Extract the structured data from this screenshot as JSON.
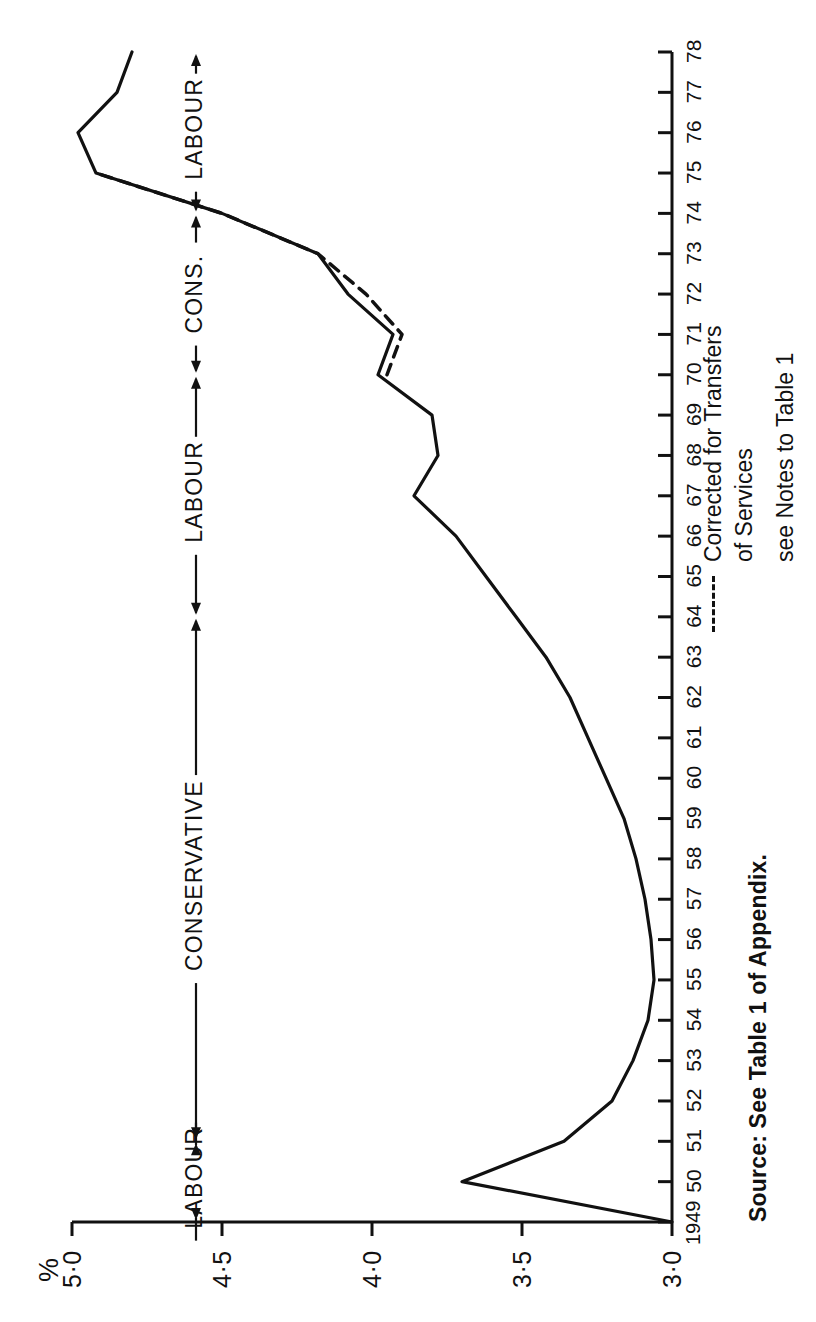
{
  "figure": {
    "orientation": "rotated-90-ccw",
    "y_axis_unit_label": "%",
    "source_note": "Source: See Table 1 of Appendix.",
    "ink_color": "#111111",
    "background_color": "#ffffff"
  },
  "legend": {
    "dash_sample_name": "dashed-line-sample",
    "lines": [
      "Corrected for Transfers",
      "of Services",
      "see Notes to Table 1"
    ]
  },
  "period_brackets": [
    {
      "label": "LABOUR",
      "start": 1949,
      "end": 1951
    },
    {
      "label": "CONSERVATIVE",
      "start": 1951,
      "end": 1964
    },
    {
      "label": "LABOUR",
      "start": 1964,
      "end": 1970
    },
    {
      "label": "CONS.",
      "start": 1970,
      "end": 1974
    },
    {
      "label": "LABOUR",
      "start": 1974,
      "end": 1978
    }
  ],
  "chart_data": {
    "type": "line",
    "title": "",
    "xlabel": "",
    "ylabel": "%",
    "xlim": [
      1949,
      1978
    ],
    "ylim": [
      3.0,
      5.0
    ],
    "yticks": [
      3.0,
      3.5,
      4.0,
      4.5,
      5.0
    ],
    "ytick_labels": [
      "3·0",
      "3·5",
      "4·0",
      "4·5",
      "5·0"
    ],
    "xticks": [
      1949,
      1950,
      1951,
      1952,
      1953,
      1954,
      1955,
      1956,
      1957,
      1958,
      1959,
      1960,
      1961,
      1962,
      1963,
      1964,
      1965,
      1966,
      1967,
      1968,
      1969,
      1970,
      1971,
      1972,
      1973,
      1974,
      1975,
      1976,
      1977,
      1978
    ],
    "xtick_labels": [
      "1949",
      "50",
      "51",
      "52",
      "53",
      "54",
      "55",
      "56",
      "57",
      "58",
      "59",
      "60",
      "61",
      "62",
      "63",
      "64",
      "65",
      "66",
      "67",
      "68",
      "69",
      "70",
      "71",
      "72",
      "73",
      "74",
      "75",
      "76",
      "77",
      "78"
    ],
    "grid": false,
    "legend_position": "inside-lower-right",
    "series": [
      {
        "name": "Defence expenditure",
        "style": "solid",
        "x": [
          1949,
          1950,
          1951,
          1952,
          1953,
          1954,
          1955,
          1956,
          1957,
          1958,
          1959,
          1960,
          1961,
          1962,
          1963,
          1964,
          1965,
          1966,
          1967,
          1968,
          1969,
          1970,
          1971,
          1972,
          1973,
          1974,
          1975,
          1976,
          1977,
          1978
        ],
        "values": [
          3.0,
          3.7,
          3.36,
          3.2,
          3.13,
          3.08,
          3.06,
          3.07,
          3.09,
          3.12,
          3.16,
          3.22,
          3.28,
          3.34,
          3.42,
          3.52,
          3.62,
          3.72,
          3.86,
          3.78,
          3.8,
          3.98,
          3.93,
          4.08,
          4.18,
          4.5,
          4.92,
          4.98,
          4.85,
          4.8
        ]
      },
      {
        "name": "Corrected for Transfers of Services",
        "style": "dashed",
        "x": [
          1970,
          1971,
          1972,
          1973,
          1974,
          1975
        ],
        "values": [
          3.95,
          3.9,
          4.02,
          4.18,
          4.5,
          4.92
        ]
      }
    ]
  }
}
